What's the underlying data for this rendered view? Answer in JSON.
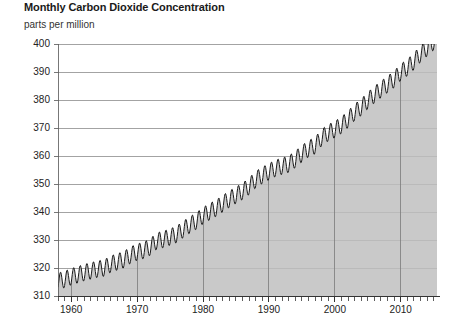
{
  "chart": {
    "title": "Monthly Carbon Dioxide Concentration",
    "y_unit_label": "parts per million"
  },
  "chart_data": {
    "type": "area",
    "title": "Monthly Carbon Dioxide Concentration",
    "subtitle": "",
    "xlabel": "",
    "ylabel": "parts per million",
    "ylim": [
      310,
      400
    ],
    "xlim": [
      1958,
      2015.5
    ],
    "ytick_labels": [
      "310",
      "320",
      "330",
      "340",
      "350",
      "360",
      "370",
      "380",
      "390",
      "400"
    ],
    "ytick_values": [
      310,
      320,
      330,
      340,
      350,
      360,
      370,
      380,
      390,
      400
    ],
    "xtick_labels": [
      "1960",
      "1970",
      "1980",
      "1990",
      "2000",
      "2010"
    ],
    "xtick_values": [
      1960,
      1970,
      1980,
      1990,
      2000,
      2010
    ],
    "minor_x_tick_interval": 1,
    "grid": true,
    "legend": "none",
    "series_name": "Monthly mean CO2 concentration (Mauna Loa)",
    "line_color": "#1a1a1a",
    "fill_color": "#c9c9c9",
    "gridline_color": "#8c8c8c",
    "seasonal_amplitude_ppm": 6,
    "annual_trend": {
      "x": [
        1958,
        1959,
        1960,
        1961,
        1962,
        1963,
        1964,
        1965,
        1966,
        1967,
        1968,
        1969,
        1970,
        1971,
        1972,
        1973,
        1974,
        1975,
        1976,
        1977,
        1978,
        1979,
        1980,
        1981,
        1982,
        1983,
        1984,
        1985,
        1986,
        1987,
        1988,
        1989,
        1990,
        1991,
        1992,
        1993,
        1994,
        1995,
        1996,
        1997,
        1998,
        1999,
        2000,
        2001,
        2002,
        2003,
        2004,
        2005,
        2006,
        2007,
        2008,
        2009,
        2010,
        2011,
        2012,
        2013,
        2014,
        2015
      ],
      "y": [
        315.3,
        315.9,
        316.9,
        317.6,
        318.4,
        319.0,
        319.6,
        320.0,
        321.4,
        322.2,
        323.0,
        324.6,
        325.7,
        326.3,
        327.5,
        329.7,
        330.2,
        331.1,
        332.0,
        333.8,
        335.4,
        336.8,
        338.7,
        340.1,
        341.4,
        343.0,
        344.6,
        346.0,
        347.4,
        349.2,
        351.6,
        353.1,
        354.4,
        355.6,
        356.4,
        357.1,
        358.8,
        360.8,
        362.6,
        363.7,
        366.6,
        368.3,
        369.5,
        371.0,
        373.1,
        375.6,
        377.4,
        379.8,
        381.9,
        383.8,
        385.6,
        387.4,
        389.9,
        391.6,
        393.8,
        396.5,
        398.6,
        400.8
      ]
    }
  }
}
